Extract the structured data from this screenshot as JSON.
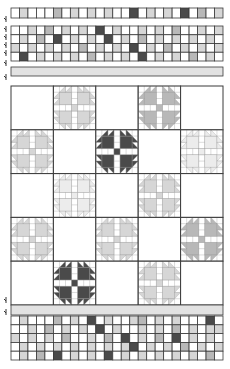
{
  "diagram": {
    "type": "quilt-layout",
    "block_pattern": "bears-paw",
    "colors": {
      "outline": "#3a3a3a",
      "white": "#ffffff",
      "very_light": "#ececec",
      "light": "#d6d6d6",
      "medium": "#b8b8b8",
      "dark": "#4a4a4a",
      "border_strip": "#e2e2e2"
    },
    "top_strip": {
      "columns": 25,
      "rows": 1,
      "cells": [
        [
          "w",
          "l",
          "w",
          "w",
          "w",
          "m",
          "w",
          "l",
          "w",
          "l",
          "w",
          "l",
          "w",
          "w",
          "d",
          "w",
          "l",
          "w",
          "l",
          "w",
          "d",
          "w",
          "m",
          "w",
          "l",
          "w"
        ]
      ]
    },
    "top_patch_band": {
      "columns": 25,
      "rows": 4,
      "cells": [
        [
          "w",
          "w",
          "l",
          "w",
          "m",
          "w",
          "l",
          "w",
          "l",
          "w",
          "d",
          "w",
          "l",
          "w",
          "w",
          "l",
          "w",
          "l",
          "w",
          "m",
          "w",
          "w",
          "l",
          "w",
          "l"
        ],
        [
          "w",
          "l",
          "w",
          "m",
          "w",
          "d",
          "w",
          "l",
          "w",
          "l",
          "w",
          "d",
          "w",
          "l",
          "w",
          "m",
          "w",
          "l",
          "w",
          "l",
          "w",
          "l",
          "w",
          "l",
          "w"
        ],
        [
          "l",
          "w",
          "l",
          "w",
          "l",
          "w",
          "l",
          "w",
          "m",
          "w",
          "l",
          "w",
          "l",
          "w",
          "d",
          "w",
          "l",
          "w",
          "m",
          "w",
          "l",
          "w",
          "l",
          "w",
          "l"
        ],
        [
          "w",
          "d",
          "w",
          "l",
          "w",
          "l",
          "w",
          "l",
          "w",
          "m",
          "w",
          "l",
          "w",
          "l",
          "w",
          "d",
          "w",
          "l",
          "w",
          "l",
          "w",
          "m",
          "w",
          "l",
          "w"
        ]
      ]
    },
    "inner_border": {
      "label": "border-strip"
    },
    "block_grid": {
      "columns": 5,
      "rows": 5,
      "blocks": [
        [
          "plain",
          "light",
          "plain",
          "medium",
          "plain"
        ],
        [
          "light",
          "plain",
          "dark",
          "plain",
          "very_light"
        ],
        [
          "plain",
          "very_light",
          "plain",
          "light",
          "plain"
        ],
        [
          "light",
          "plain",
          "light",
          "plain",
          "medium"
        ],
        [
          "plain",
          "dark",
          "plain",
          "light",
          "plain"
        ]
      ]
    },
    "bottom_border": {
      "label": "border-strip"
    },
    "bottom_patch_band": {
      "columns": 25,
      "rows": 5,
      "cells": [
        [
          "w",
          "l",
          "w",
          "w",
          "w",
          "m",
          "w",
          "l",
          "w",
          "d",
          "w",
          "l",
          "w",
          "w",
          "l",
          "m",
          "w",
          "l",
          "w",
          "l",
          "w",
          "w",
          "w",
          "d",
          "w"
        ],
        [
          "w",
          "w",
          "l",
          "w",
          "m",
          "w",
          "l",
          "w",
          "l",
          "w",
          "d",
          "w",
          "l",
          "w",
          "w",
          "l",
          "w",
          "l",
          "w",
          "m",
          "w",
          "l",
          "w",
          "l",
          "l"
        ],
        [
          "l",
          "w",
          "l",
          "w",
          "l",
          "w",
          "m",
          "w",
          "w",
          "l",
          "w",
          "m",
          "w",
          "d",
          "w",
          "l",
          "w",
          "m",
          "w",
          "d",
          "w",
          "l",
          "w",
          "l",
          "w"
        ],
        [
          "w",
          "l",
          "w",
          "l",
          "w",
          "l",
          "w",
          "l",
          "w",
          "l",
          "w",
          "l",
          "w",
          "l",
          "d",
          "w",
          "l",
          "w",
          "l",
          "w",
          "m",
          "w",
          "l",
          "w",
          "l"
        ],
        [
          "w",
          "l",
          "w",
          "m",
          "w",
          "d",
          "w",
          "l",
          "w",
          "l",
          "w",
          "d",
          "w",
          "l",
          "w",
          "l",
          "w",
          "l",
          "w",
          "l",
          "w",
          "l",
          "w",
          "m",
          "w"
        ]
      ]
    },
    "section_markers": [
      {
        "y": 19
      },
      {
        "y": 29
      },
      {
        "y": 37
      },
      {
        "y": 45
      },
      {
        "y": 53
      },
      {
        "y": 63
      },
      {
        "y": 77
      },
      {
        "y": 300
      },
      {
        "y": 312
      }
    ]
  }
}
